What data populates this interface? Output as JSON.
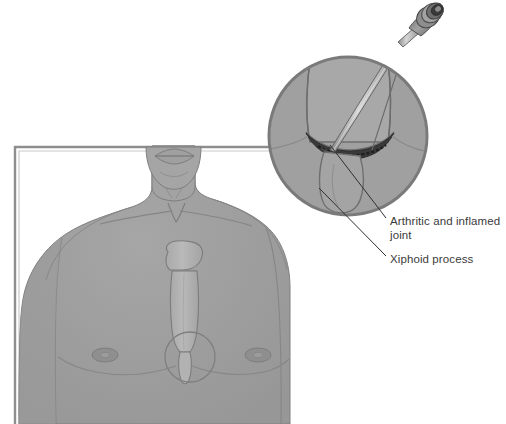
{
  "figure": {
    "type": "medical-illustration",
    "background_color": "#ffffff"
  },
  "palette": {
    "skin_fill": "#9d9d9d",
    "skin_shadow": "#949494",
    "skin_highlight": "#a8a8a8",
    "bone_fill": "#b0b0b0",
    "bone_light": "#b8b8b8",
    "outline": "#6f6f6f",
    "outline_soft": "#8a8a8a",
    "joint_dark": "#333333",
    "circle_stroke": "#7a7a7a",
    "frame_stroke": "#8e8e8e",
    "needle_fill": "#c9c9c9",
    "needle_stroke": "#5a5a5a",
    "syringe_dark": "#4a4a4a",
    "syringe_mid": "#8c8c8c",
    "leader_line": "#2f2f2f",
    "text_color": "#3b3b3b"
  },
  "frame": {
    "name": "illustration-border",
    "x": 15,
    "y": 147,
    "width": 275,
    "height": 277
  },
  "inset": {
    "name": "magnified-circle",
    "center_x": 348,
    "center_y": 136,
    "radius": 80,
    "stroke_width": 3
  },
  "marker_circle": {
    "name": "region-of-interest-marker",
    "center_x": 190,
    "center_y": 357,
    "radius": 25
  },
  "labels": [
    {
      "id": "arthritic",
      "text": "Arthritic and inflamed\njoint",
      "x": 390,
      "y": 214,
      "leader_from_x": 383,
      "leader_from_y": 218,
      "leader_to_x": 328,
      "leader_to_y": 144
    },
    {
      "id": "xiphoid",
      "text": "Xiphoid process",
      "x": 390,
      "y": 252,
      "leader_from_x": 383,
      "leader_from_y": 256,
      "leader_to_x": 318,
      "leader_to_y": 186
    }
  ],
  "anatomy": {
    "parts": [
      "head-chin",
      "mouth",
      "neck",
      "clavicle-left",
      "clavicle-right",
      "shoulder-left",
      "shoulder-right",
      "pectoral-left",
      "pectoral-right",
      "nipple-left",
      "nipple-right",
      "manubrium",
      "sternum-body",
      "xiphoid-process",
      "sternal-notch"
    ]
  },
  "instrument": {
    "name": "syringe-needle",
    "tip_x": 330,
    "tip_y": 148,
    "hub_x": 420,
    "hub_y": 18
  }
}
